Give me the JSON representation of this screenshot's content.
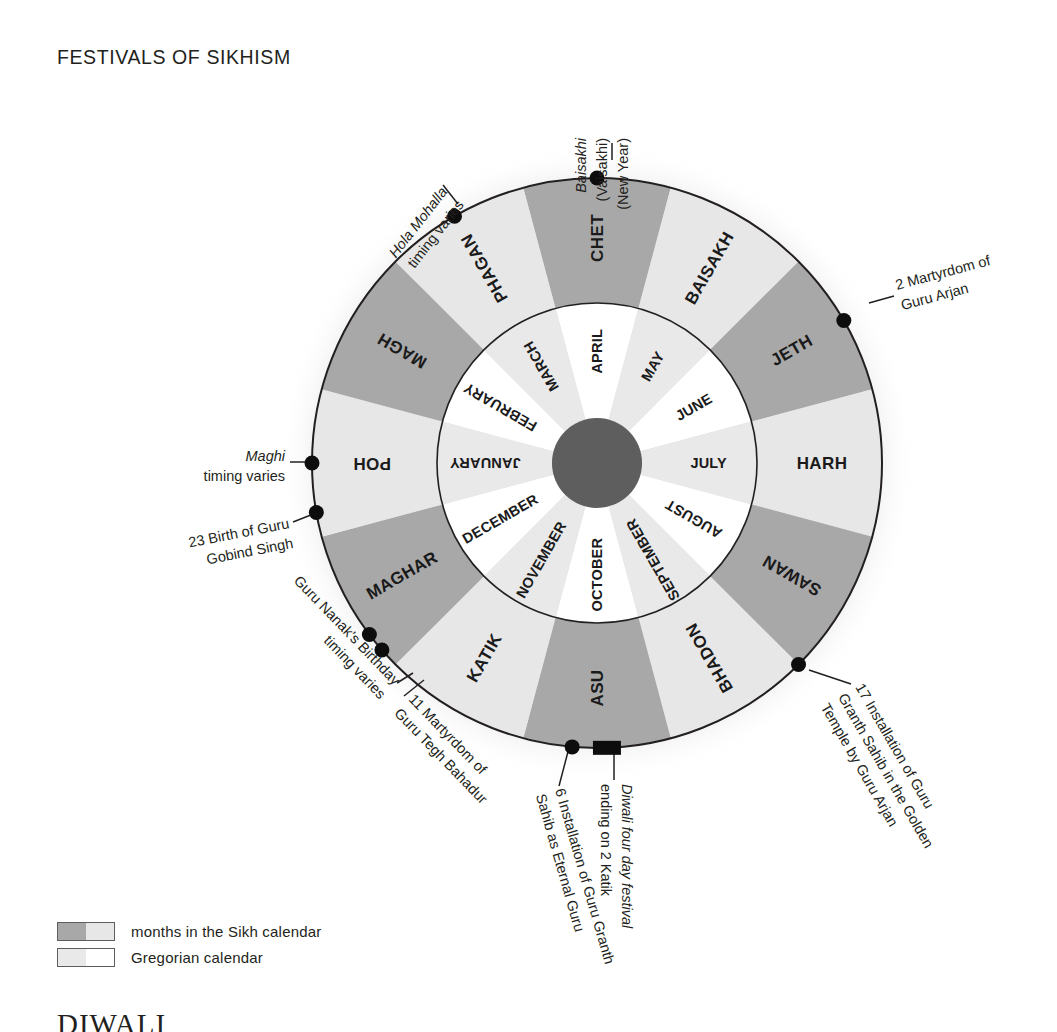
{
  "page": {
    "title": "FESTIVALS OF SIKHISM",
    "footer_heading": "DIWALI"
  },
  "colors": {
    "sikh_dark": "#a8a8a8",
    "sikh_light": "#e7e7e7",
    "gregorian_light": "#e9e9e9",
    "gregorian_white": "#ffffff",
    "hub": "#5e5e5e",
    "outline": "#231f20",
    "marker": "#0d0d0d"
  },
  "wheel": {
    "center_x": 597,
    "center_y": 463,
    "outer_radius": 285,
    "inner_ring_outer_radius": 160,
    "inner_ring_inner_radius": 45,
    "outer_offset_degrees": -15,
    "sikh_months": [
      {
        "name": "CHET",
        "shade": "dark"
      },
      {
        "name": "BAISAKH",
        "shade": "light"
      },
      {
        "name": "JETH",
        "shade": "dark"
      },
      {
        "name": "HARH",
        "shade": "light"
      },
      {
        "name": "SAWAN",
        "shade": "dark"
      },
      {
        "name": "BHADON",
        "shade": "light"
      },
      {
        "name": "ASU",
        "shade": "dark"
      },
      {
        "name": "KATIK",
        "shade": "light"
      },
      {
        "name": "MAGHAR",
        "shade": "dark"
      },
      {
        "name": "POH",
        "shade": "light"
      },
      {
        "name": "MAGH",
        "shade": "dark"
      },
      {
        "name": "PHAGAN",
        "shade": "light"
      }
    ],
    "gregorian_months": [
      {
        "name": "APRIL",
        "shade": "white"
      },
      {
        "name": "MAY",
        "shade": "light"
      },
      {
        "name": "JUNE",
        "shade": "white"
      },
      {
        "name": "JULY",
        "shade": "light"
      },
      {
        "name": "AUGUST",
        "shade": "white"
      },
      {
        "name": "SEPTEMBER",
        "shade": "light"
      },
      {
        "name": "OCTOBER",
        "shade": "white"
      },
      {
        "name": "NOVEMBER",
        "shade": "light"
      },
      {
        "name": "DECEMBER",
        "shade": "white"
      },
      {
        "name": "JANUARY",
        "shade": "light"
      },
      {
        "name": "FEBRUARY",
        "shade": "white"
      },
      {
        "name": "MARCH",
        "shade": "light"
      }
    ]
  },
  "callouts": [
    {
      "id": "baisakhi",
      "angle": -90,
      "marker": "dot",
      "lines": [
        {
          "text": "Baisakhi",
          "italic": true
        },
        {
          "text": "(Vaisakhi)",
          "italic": false
        },
        {
          "text": "(New Year)",
          "italic": false
        }
      ],
      "text_x": 586,
      "text_y": 138,
      "rotate": -90,
      "anchor": "end",
      "leader": {
        "x1": 612,
        "y1": 160,
        "x2": 612,
        "y2": 143
      },
      "line_gap": 21
    },
    {
      "id": "hola-mohalla",
      "angle": -120,
      "marker": "dot",
      "lines": [
        {
          "text": "Hola Mohalla",
          "italic": true
        },
        {
          "text": "timing varies",
          "italic": false
        }
      ],
      "text_x": 448,
      "text_y": 192,
      "rotate": -52,
      "anchor": "end",
      "leader": {
        "x1": 458,
        "y1": 204,
        "x2": 443,
        "y2": 185
      },
      "line_gap": 21
    },
    {
      "id": "martyrdom-guru-arjan",
      "angle": -30,
      "marker": "dot",
      "lines": [
        {
          "text": "2 Martyrdom of",
          "italic": false
        },
        {
          "text": "Guru Arjan",
          "italic": false
        }
      ],
      "text_x": 897,
      "text_y": 290,
      "rotate": -15,
      "anchor": "start",
      "leader": {
        "x1": 869,
        "y1": 303,
        "x2": 894,
        "y2": 296
      },
      "line_gap": 21
    },
    {
      "id": "installation-golden-temple",
      "angle": 45,
      "marker": "dot",
      "lines": [
        {
          "text": "17 Installation of Guru",
          "italic": false
        },
        {
          "text": "Granth Sahib in the Golden",
          "italic": false
        },
        {
          "text": "Temple by Guru Arjan",
          "italic": false
        }
      ],
      "text_x": 855,
      "text_y": 687,
      "rotate": 60,
      "anchor": "start",
      "leader": {
        "x1": 809,
        "y1": 670,
        "x2": 851,
        "y2": 684
      },
      "line_gap": 20
    },
    {
      "id": "diwali",
      "angle": 88,
      "marker": "rect",
      "lines": [
        {
          "text": "Diwali four day festival",
          "italic": true
        },
        {
          "text": "ending on 2 Katik",
          "italic": false
        }
      ],
      "text_x": 622,
      "text_y": 784,
      "rotate": 90,
      "anchor": "start",
      "leader": {
        "x1": 614,
        "y1": 753,
        "x2": 614,
        "y2": 780
      },
      "line_gap": 21
    },
    {
      "id": "installation-eternal-guru",
      "angle": 95,
      "marker": "dot",
      "lines": [
        {
          "text": "6 Installation of Guru Granth",
          "italic": false
        },
        {
          "text": "Sahib as Eternal Guru",
          "italic": false
        }
      ],
      "text_x": 555,
      "text_y": 790,
      "rotate": 74,
      "anchor": "start",
      "leader": {
        "x1": 570,
        "y1": 744,
        "x2": 559,
        "y2": 786
      },
      "line_gap": 20
    },
    {
      "id": "martyrdom-guru-tegh-bahadur",
      "angle": 139,
      "marker": "dot",
      "lines": [
        {
          "text": "11 Martyrdom of",
          "italic": false
        },
        {
          "text": "Guru Tegh Bahadur",
          "italic": false
        }
      ],
      "text_x": 408,
      "text_y": 700,
      "rotate": 46,
      "anchor": "start",
      "leader": {
        "x1": 424,
        "y1": 680,
        "x2": 404,
        "y2": 696
      },
      "line_gap": 20
    },
    {
      "id": "guru-nanaks-birthday",
      "angle": 143,
      "marker": "dot",
      "lines": [
        {
          "text": "Guru Nanak's Birthday",
          "italic": false
        },
        {
          "text": "timing varies",
          "italic": false
        }
      ],
      "text_x": 394,
      "text_y": 686,
      "rotate": 46,
      "anchor": "end",
      "leader": {
        "x1": 413,
        "y1": 673,
        "x2": 397,
        "y2": 683
      },
      "line_gap": 20
    },
    {
      "id": "maghi",
      "angle": 180,
      "marker": "dot",
      "lines": [
        {
          "text": "Maghi",
          "italic": true
        },
        {
          "text": "timing varies",
          "italic": false
        }
      ],
      "text_x": 285,
      "text_y": 461,
      "rotate": 0,
      "anchor": "end",
      "leader": {
        "x1": 312,
        "y1": 462,
        "x2": 290,
        "y2": 462
      },
      "line_gap": 20
    },
    {
      "id": "birth-guru-gobind-singh",
      "angle": 170,
      "marker": "dot",
      "lines": [
        {
          "text": "23 Birth of Guru",
          "italic": false
        },
        {
          "text": "Gobind Singh",
          "italic": false
        }
      ],
      "text_x": 290,
      "text_y": 528,
      "rotate": -11,
      "anchor": "end",
      "leader": {
        "x1": 316,
        "y1": 513,
        "x2": 293,
        "y2": 522
      },
      "line_gap": 20
    }
  ],
  "legend": {
    "items": [
      {
        "label": "months in the Sikh calendar",
        "left_color": "#a8a8a8",
        "right_color": "#e7e7e7"
      },
      {
        "label": "Gregorian calendar",
        "left_color": "#e9e9e9",
        "right_color": "#ffffff"
      }
    ]
  }
}
